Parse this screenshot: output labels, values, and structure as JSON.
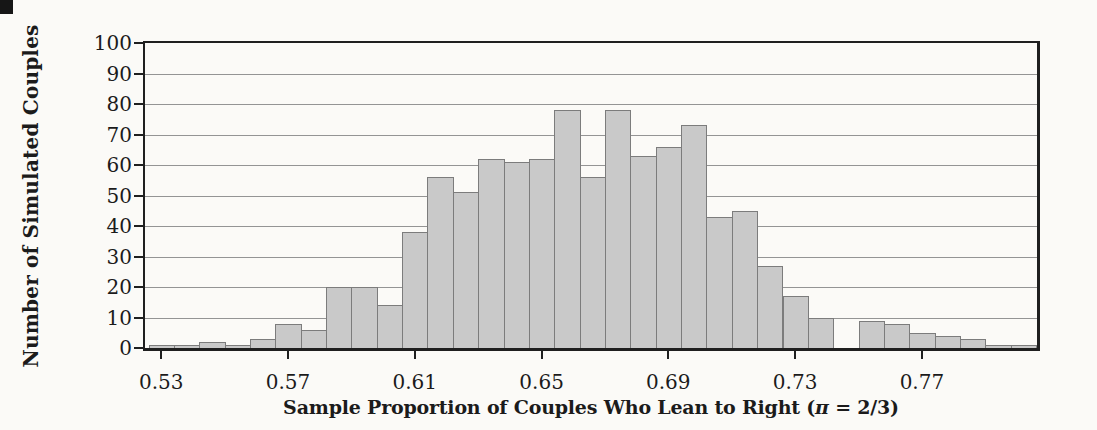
{
  "figure": {
    "corner_mark_color": "#161616",
    "background_color": "#fbfaf7"
  },
  "chart_data": {
    "type": "bar",
    "subtype": "histogram",
    "title": "",
    "ylabel": "Number of Simulated Couples",
    "xlabel_prefix": "Sample Proportion of Couples Who Lean to Right (",
    "xlabel_pi": "π",
    "xlabel_suffix": " = 2/3)",
    "bin_width": 0.008,
    "bin_centers": [
      0.53,
      0.538,
      0.546,
      0.554,
      0.562,
      0.57,
      0.578,
      0.586,
      0.594,
      0.602,
      0.61,
      0.618,
      0.626,
      0.634,
      0.642,
      0.65,
      0.658,
      0.666,
      0.674,
      0.682,
      0.69,
      0.698,
      0.706,
      0.714,
      0.722,
      0.73,
      0.738,
      0.746,
      0.754,
      0.762,
      0.77,
      0.778,
      0.786,
      0.794,
      0.802
    ],
    "values": [
      1,
      1,
      2,
      1,
      3,
      8,
      6,
      20,
      20,
      14,
      38,
      56,
      51,
      62,
      61,
      62,
      78,
      56,
      78,
      63,
      66,
      73,
      43,
      45,
      27,
      17,
      10,
      0,
      9,
      8,
      5,
      4,
      3,
      1,
      1
    ],
    "x_ticks": [
      {
        "value": 0.53,
        "label": "0.53"
      },
      {
        "value": 0.57,
        "label": "0.57"
      },
      {
        "value": 0.61,
        "label": "0.61"
      },
      {
        "value": 0.65,
        "label": "0.65"
      },
      {
        "value": 0.69,
        "label": "0.69"
      },
      {
        "value": 0.73,
        "label": "0.73"
      },
      {
        "value": 0.77,
        "label": "0.77"
      }
    ],
    "y_ticks": [
      0,
      10,
      20,
      30,
      40,
      50,
      60,
      70,
      80,
      90,
      100
    ],
    "xlim": [
      0.5249,
      0.8063
    ],
    "ylim": [
      0,
      100
    ],
    "grid": "horizontal",
    "legend": "none",
    "bar_fill": "#c9c9c9",
    "bar_border": "#7c7c7c",
    "gridline_color": "#949494",
    "frame_color": "#1f1f1f",
    "text_color": "#1b1b1b"
  }
}
